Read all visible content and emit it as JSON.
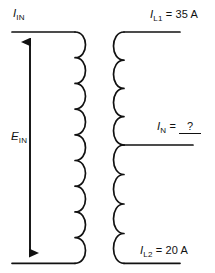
{
  "diagram": {
    "type": "center-tapped-transformer-schematic",
    "stroke_color": "#111111",
    "background_color": "#ffffff",
    "primary": {
      "name": "primary-winding",
      "turns": 9,
      "source_label": {
        "symbol": "E",
        "subscript": "IN",
        "text": "E IN"
      },
      "current_label": {
        "symbol": "I",
        "subscript": "IN",
        "text": "I IN"
      },
      "arrow": "double-headed-vertical"
    },
    "secondary": {
      "name": "secondary-winding",
      "turns": 8,
      "turns_above_tap": 4,
      "turns_below_tap": 4,
      "center_tap": true,
      "top_terminal": {
        "symbol": "I",
        "subscript": "L1",
        "equals": "=",
        "value": "35 A",
        "text": "I L1 = 35 A"
      },
      "center_tap_terminal": {
        "symbol": "I",
        "subscript": "N",
        "equals": "=",
        "value": "?",
        "text": "I N = ?",
        "is_blank": true
      },
      "bottom_terminal": {
        "symbol": "I",
        "subscript": "L2",
        "equals": "=",
        "value": "20 A",
        "text": "I L2 = 20 A"
      }
    }
  }
}
